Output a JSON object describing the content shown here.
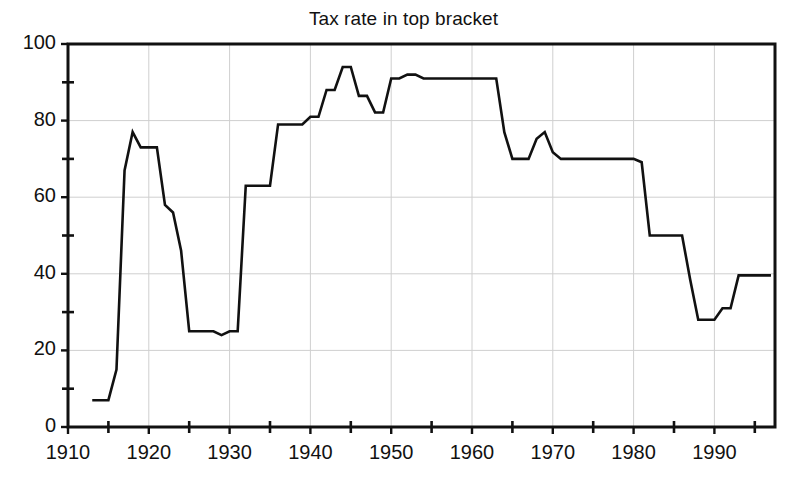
{
  "chart_data": {
    "type": "line",
    "title": "Tax rate in top bracket",
    "xlabel": "",
    "ylabel": "",
    "xlim": [
      1910,
      1997.5
    ],
    "ylim": [
      0,
      100
    ],
    "grid": true,
    "legend": "none",
    "x_major_ticks": [
      1910,
      1920,
      1930,
      1940,
      1950,
      1960,
      1970,
      1980,
      1990
    ],
    "x_tick_labels": [
      "1910",
      "1920",
      "1930",
      "1940",
      "1950",
      "1960",
      "1970",
      "1980",
      "1990"
    ],
    "x_minor_ticks": [
      1915,
      1925,
      1935,
      1945,
      1955,
      1965,
      1975,
      1985,
      1995
    ],
    "y_major_ticks": [
      0,
      20,
      40,
      60,
      80,
      100
    ],
    "y_tick_labels": [
      "0",
      "20",
      "40",
      "60",
      "80",
      "100"
    ],
    "y_minor_ticks": [
      10,
      30,
      50,
      70,
      90
    ],
    "series": [
      {
        "name": "Top marginal tax rate",
        "color": "#111111",
        "line_width": 2.6,
        "x": [
          1913,
          1914,
          1915,
          1916,
          1917,
          1918,
          1919,
          1920,
          1921,
          1922,
          1923,
          1924,
          1925,
          1926,
          1927,
          1928,
          1929,
          1930,
          1931,
          1932,
          1933,
          1934,
          1935,
          1936,
          1937,
          1938,
          1939,
          1940,
          1941,
          1942,
          1943,
          1944,
          1945,
          1946,
          1947,
          1948,
          1949,
          1950,
          1951,
          1952,
          1953,
          1954,
          1955,
          1956,
          1957,
          1958,
          1959,
          1960,
          1961,
          1962,
          1963,
          1964,
          1965,
          1966,
          1967,
          1968,
          1969,
          1970,
          1971,
          1972,
          1973,
          1974,
          1975,
          1976,
          1977,
          1978,
          1979,
          1980,
          1981,
          1982,
          1983,
          1984,
          1985,
          1986,
          1987,
          1988,
          1989,
          1990,
          1991,
          1992,
          1993,
          1994,
          1995,
          1996,
          1997
        ],
        "y": [
          7,
          7,
          7,
          15,
          67,
          77,
          73,
          73,
          73,
          58,
          56,
          46,
          25,
          25,
          25,
          25,
          24,
          25,
          25,
          63,
          63,
          63,
          63,
          79,
          79,
          79,
          79,
          81,
          81,
          88,
          88,
          94,
          94,
          86.45,
          86.45,
          82.13,
          82.13,
          91,
          91,
          92,
          92,
          91,
          91,
          91,
          91,
          91,
          91,
          91,
          91,
          91,
          91,
          77,
          70,
          70,
          70,
          75.25,
          77,
          71.75,
          70,
          70,
          70,
          70,
          70,
          70,
          70,
          70,
          70,
          70,
          69.125,
          50,
          50,
          50,
          50,
          50,
          38.5,
          28,
          28,
          28,
          31,
          31,
          39.6,
          39.6,
          39.6,
          39.6,
          39.6
        ]
      }
    ],
    "annotations": []
  },
  "figure": {
    "background": "#ffffff",
    "frame_color": "#111111",
    "grid_color": "#cfcfcf"
  }
}
